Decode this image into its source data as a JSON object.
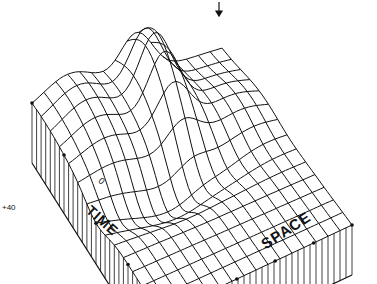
{
  "figure": {
    "type": "3d-surface-mesh",
    "axes": {
      "time_label": "TIME",
      "space_label": "SPACE",
      "origin_label": "0"
    },
    "side_annotation": "+40",
    "peak_marker": "down-arrow",
    "colors": {
      "line": "#111111",
      "background": "#ffffff"
    }
  }
}
